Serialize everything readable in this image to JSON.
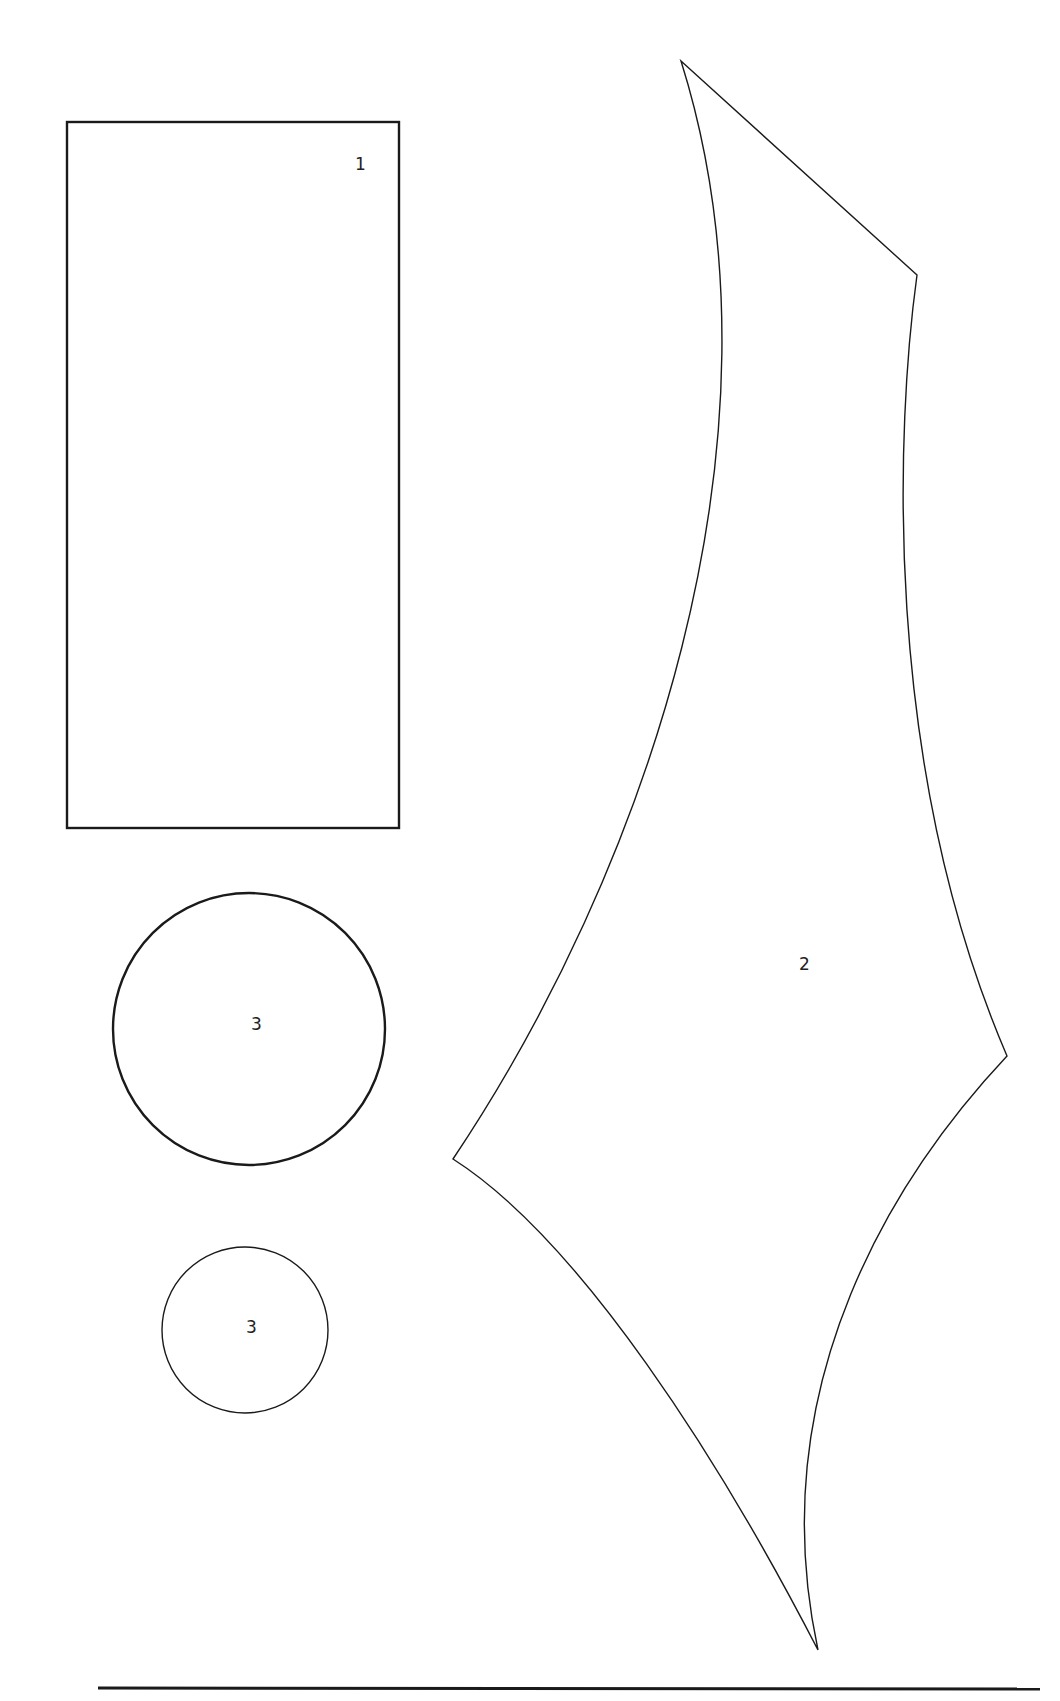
{
  "diagram": {
    "shapes": [
      {
        "id": "rect",
        "type": "rectangle",
        "label": "1"
      },
      {
        "id": "curved-quad",
        "type": "curved-quadrilateral",
        "label": "2"
      },
      {
        "id": "circle-large",
        "type": "circle",
        "label": "3"
      },
      {
        "id": "circle-small",
        "type": "circle",
        "label": "3"
      }
    ],
    "stroke_color": "#1a1a1a",
    "background": "#ffffff"
  }
}
